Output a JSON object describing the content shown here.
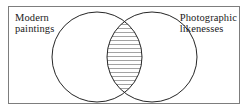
{
  "figure": {
    "type": "venn-diagram",
    "set_count": 2,
    "background_color": "#ffffff",
    "frame": {
      "visible": true,
      "stroke_color": "#7d7d7d",
      "stroke_width": 1
    },
    "circle_style": {
      "stroke_color": "#262626",
      "stroke_width": 1,
      "fill_color": "#ffffff"
    },
    "intersection": {
      "fill_pattern": "horizontal-hatch",
      "hatch_color": "#8c8c8c",
      "hatch_spacing_px": 4,
      "shaded": true
    }
  },
  "sets": [
    {
      "id": "left",
      "label_line1": "Modern",
      "label_line2": "paintings",
      "label_position": "top-left",
      "cx": 97,
      "cy": 57,
      "r": 45
    },
    {
      "id": "right",
      "label_line1": "Photographic",
      "label_line2": "likenesses",
      "label_position": "top-right",
      "cx": 152,
      "cy": 57,
      "r": 45
    }
  ]
}
